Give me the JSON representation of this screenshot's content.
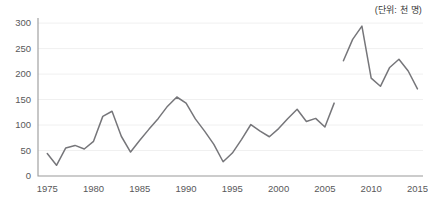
{
  "annotations": {
    "unit_label": "(단위: 천 명)"
  },
  "chart_data": {
    "type": "line",
    "title": "",
    "subtitle": "",
    "xlabel": "",
    "ylabel": "",
    "unit_note": "(단위: 천 명)",
    "xlim": [
      1974,
      2015.6
    ],
    "ylim": [
      0,
      310
    ],
    "yticks": [
      0,
      50,
      100,
      150,
      200,
      250,
      300
    ],
    "ytick_labels": [
      "0",
      "50",
      "100",
      "150",
      "200",
      "250",
      "300"
    ],
    "xticks": [
      1975,
      1980,
      1985,
      1990,
      1995,
      2000,
      2005,
      2010,
      2015
    ],
    "xtick_labels": [
      "1975",
      "1980",
      "1985",
      "1990",
      "1995",
      "2000",
      "2005",
      "2010",
      "2015"
    ],
    "grid": true,
    "grid_axis": "y",
    "legend": false,
    "legend_position": "none",
    "line_color": "#76767a",
    "series": [
      {
        "name": "1975-2006",
        "color": "#76767a",
        "x": [
          1975,
          1976,
          1977,
          1978,
          1979,
          1980,
          1981,
          1982,
          1983,
          1984,
          1985,
          1986,
          1987,
          1988,
          1989,
          1990,
          1991,
          1992,
          1993,
          1994,
          1995,
          1996,
          1997,
          1998,
          1999,
          2000,
          2001,
          2002,
          2003,
          2004,
          2005,
          2006
        ],
        "values": [
          44,
          21,
          55,
          60,
          53,
          68,
          117,
          127,
          78,
          47,
          70,
          92,
          113,
          137,
          155,
          143,
          112,
          88,
          62,
          28,
          45,
          72,
          101,
          88,
          77,
          93,
          113,
          131,
          107,
          113,
          96,
          143
        ]
      },
      {
        "name": "2007-2015",
        "color": "#76767a",
        "x": [
          2007,
          2008,
          2009,
          2010,
          2011,
          2012,
          2013,
          2014,
          2015
        ],
        "values": [
          226,
          268,
          294,
          192,
          176,
          213,
          229,
          206,
          171
        ]
      }
    ]
  }
}
